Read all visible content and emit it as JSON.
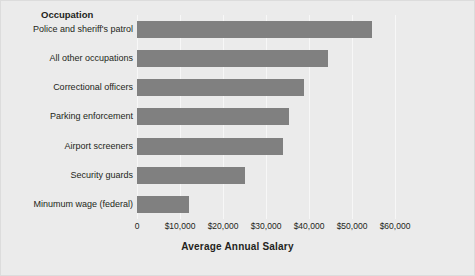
{
  "chart_data": {
    "type": "bar",
    "orientation": "horizontal",
    "title": "",
    "category_header": "Occupation",
    "xlabel": "Average Annual Salary",
    "ylabel": "",
    "categories": [
      "Police and sheriff's patrol",
      "All other occupations",
      "Correctional officers",
      "Parking enforcement",
      "Airport screeners",
      "Security guards",
      "Minumum wage (federal)"
    ],
    "values": [
      54700,
      44400,
      38800,
      35300,
      34000,
      25000,
      12000
    ],
    "xlim": [
      0,
      60000
    ],
    "xticks": [
      0,
      10000,
      20000,
      30000,
      40000,
      50000,
      60000
    ],
    "xticklabels": [
      "0",
      "$10,000",
      "$20,000",
      "$30,000",
      "$40,000",
      "$50,000",
      "$60,000"
    ],
    "grid": true,
    "grid_axis": "x",
    "legend": false,
    "bar_color": "#808080",
    "background_color": "#ebebeb",
    "gridline_color": "#f7f7f7",
    "text_color": "#231f20"
  }
}
